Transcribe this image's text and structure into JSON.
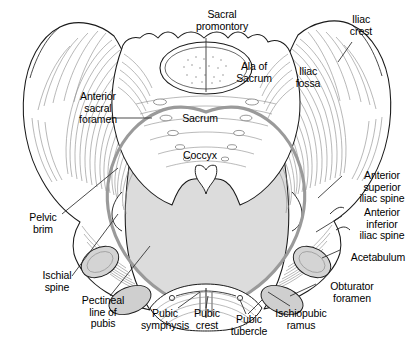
{
  "figure": {
    "view": "anterior",
    "background_color": "#ffffff",
    "ink_color": "#1a1a1a",
    "inlet_fill_color": "#dcdcdc",
    "pelvic_brim_color": "#9a9a9a",
    "foramen_fill_color": "#cfcfcf",
    "hatch_color": "#8c8c8c",
    "label_color": "#000000",
    "leader_color": "#3a3a3a"
  },
  "labels": [
    {
      "id": "sacral-promontory",
      "text": "Sacral\npromontory",
      "x": 181,
      "y": 9,
      "w": 82,
      "align": "center"
    },
    {
      "id": "iliac-crest",
      "text": "Iliac\ncrest",
      "x": 335,
      "y": 14,
      "w": 52,
      "align": "center"
    },
    {
      "id": "ala-of-sacrum",
      "text": "Ala of\nSacrum",
      "x": 228,
      "y": 61,
      "w": 52,
      "align": "center"
    },
    {
      "id": "iliac-fossa",
      "text": "Iliac\nfossa",
      "x": 285,
      "y": 66,
      "w": 46,
      "align": "center"
    },
    {
      "id": "anterior-sacral-foramen",
      "text": "Anterior\nsacral\nforamen",
      "x": 63,
      "y": 91,
      "w": 70,
      "align": "center"
    },
    {
      "id": "sacrum",
      "text": "Sacrum",
      "x": 176,
      "y": 113,
      "w": 48,
      "align": "center"
    },
    {
      "id": "coccyx",
      "text": "Coccyx",
      "x": 176,
      "y": 150,
      "w": 48,
      "align": "center"
    },
    {
      "id": "anterior-superior-iliac-spine",
      "text": "Anterior\nsuperior\niliac spine",
      "x": 351,
      "y": 170,
      "w": 62,
      "align": "center"
    },
    {
      "id": "pelvic-brim",
      "text": "Pelvic\nbrim",
      "x": 18,
      "y": 212,
      "w": 50,
      "align": "center"
    },
    {
      "id": "anterior-inferior-iliac-spine",
      "text": "Anterior\ninferior\niliac spine",
      "x": 351,
      "y": 207,
      "w": 62,
      "align": "center"
    },
    {
      "id": "acetabulum",
      "text": "Acetabulum",
      "x": 345,
      "y": 252,
      "w": 68,
      "align": "center"
    },
    {
      "id": "ischial-spine",
      "text": "Ischial\nspine",
      "x": 32,
      "y": 270,
      "w": 50,
      "align": "center"
    },
    {
      "id": "obturator-foramen",
      "text": "Obturator\nforamen",
      "x": 320,
      "y": 281,
      "w": 64,
      "align": "center"
    },
    {
      "id": "pectineal-line-of-pubis",
      "text": "Pectineal\nline of\npubis",
      "x": 73,
      "y": 295,
      "w": 60,
      "align": "center"
    },
    {
      "id": "ischiopubic-ramus",
      "text": "Ischiopubic\nramus",
      "x": 268,
      "y": 308,
      "w": 66,
      "align": "center"
    },
    {
      "id": "pubic-symphysis",
      "text": "Pubic\nsymphysis",
      "x": 135,
      "y": 308,
      "w": 60,
      "align": "center"
    },
    {
      "id": "pubic-crest",
      "text": "Pubic\ncrest",
      "x": 186,
      "y": 308,
      "w": 42,
      "align": "center"
    },
    {
      "id": "pubic-tubercle",
      "text": "Pubic\ntubercle",
      "x": 223,
      "y": 314,
      "w": 52,
      "align": "center"
    }
  ],
  "anatomy_parts": [
    "left-ilium",
    "right-ilium",
    "iliac-crest",
    "iliac-fossa",
    "sacrum",
    "sacral-ala",
    "sacral-promontory",
    "anterior-sacral-foramina",
    "coccyx",
    "pelvic-inlet",
    "pelvic-brim",
    "pectineal-line",
    "acetabulum-left",
    "acetabulum-right",
    "obturator-foramen-left",
    "obturator-foramen-right",
    "pubic-symphysis",
    "pubic-crest",
    "pubic-tubercle",
    "ischiopubic-ramus",
    "ischial-spine",
    "anterior-superior-iliac-spine",
    "anterior-inferior-iliac-spine"
  ]
}
